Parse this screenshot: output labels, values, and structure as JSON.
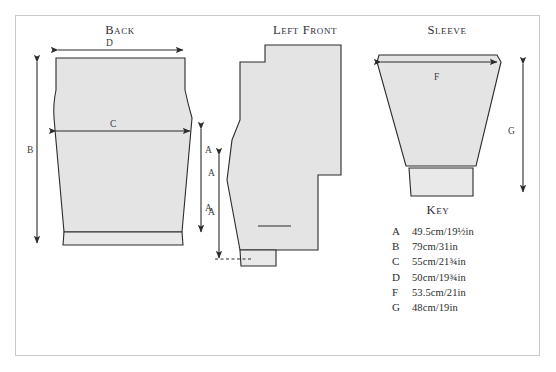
{
  "document": {
    "type": "knitting-pattern-schematic"
  },
  "panels": [
    {
      "id": "back",
      "title": "Back"
    },
    {
      "id": "left_front",
      "title": "Left Front"
    },
    {
      "id": "sleeve",
      "title": "Sleeve"
    }
  ],
  "dimension_labels": {
    "back_width_top": "D",
    "back_height": "B",
    "back_width_chest": "C",
    "back_side_upper": "A",
    "back_side_lower": "A",
    "left_front_upper": "A",
    "left_front_lower": "A",
    "sleeve_width_top": "F",
    "sleeve_height": "G"
  },
  "key": {
    "title": "Key",
    "entries": [
      {
        "letter": "A",
        "cm": "49.5cm",
        "inches_whole": "19",
        "inches_fraction": "1/2",
        "value": "49.5cm/19½in"
      },
      {
        "letter": "B",
        "cm": "79cm",
        "inches_whole": "31",
        "inches_fraction": "",
        "value": "79cm/31in"
      },
      {
        "letter": "C",
        "cm": "55cm",
        "inches_whole": "21",
        "inches_fraction": "3/4",
        "value": "55cm/21¾im"
      },
      {
        "letter": "D",
        "cm": "50cm",
        "inches_whole": "19",
        "inches_fraction": "3/4",
        "value": "50cm/19¾im"
      },
      {
        "letter": "F",
        "cm": "53.5cm",
        "inches_whole": "21",
        "inches_fraction": "",
        "value": "53.5cm/21in"
      },
      {
        "letter": "G",
        "cm": "48cm",
        "inches_whole": "19",
        "inches_fraction": "",
        "value": "48cm/19in"
      }
    ],
    "entries_display": [
      "49.5cm/19½in",
      "79cm/31in",
      "55cm/21¾in",
      "50cm/19¾in",
      "53.5cm/21in",
      "48cm/19in"
    ]
  },
  "colors": {
    "piece_fill": "#e4e4e4",
    "piece_stroke": "#2b2b2b",
    "frame_border": "#c9c9c9",
    "page_background": "#ffffff",
    "text": "#2b2b2b"
  }
}
